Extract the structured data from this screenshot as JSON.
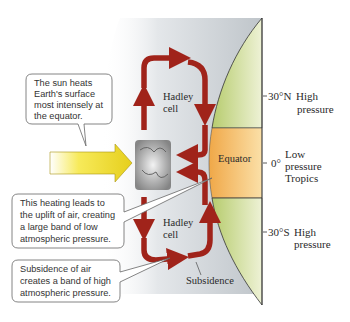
{
  "callouts": {
    "sun_heating": [
      "The sun heats",
      "Earth's surface",
      "most intensely at",
      "the equator."
    ],
    "uplift": [
      "This heating leads to",
      "the uplift of air, creating",
      "a large band of low",
      "atmospheric pressure."
    ],
    "subsidence": [
      "Subsidence of air",
      "creates a band of high",
      "atmospheric pressure."
    ]
  },
  "cells": {
    "north": [
      "Hadley",
      "cell"
    ],
    "south": [
      "Hadley",
      "cell"
    ]
  },
  "equator_label": "Equator",
  "subsidence_label": "Subsidence",
  "latitudes": [
    {
      "id": "30N",
      "tick": "30°N",
      "lines": [
        "High",
        "pressure"
      ]
    },
    {
      "id": "0",
      "tick": "0°",
      "lines": [
        "Low",
        "pressure",
        "Tropics"
      ]
    },
    {
      "id": "30S",
      "tick": "30°S",
      "lines": [
        "High",
        "pressure"
      ]
    }
  ],
  "colors": {
    "hadley_arrow": "#a0231a",
    "sun_arrow": "#f2e12a",
    "tropics_band": "#f3b85a",
    "land_green": "#c9d98b",
    "atmosphere": "#c7ccd0"
  }
}
